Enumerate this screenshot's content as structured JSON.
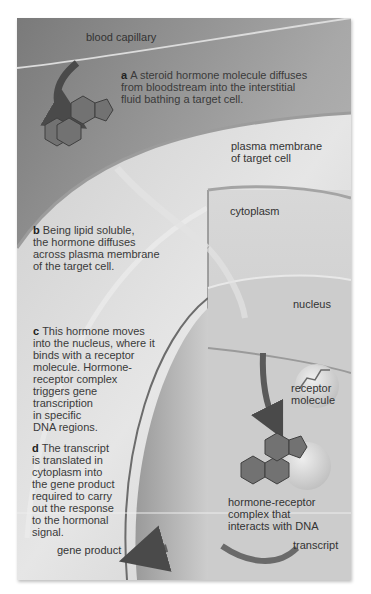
{
  "diagram": {
    "colors": {
      "background": "#ffffff",
      "interstitial": "#b5b5b5",
      "capillary": "#8e8e8e",
      "cytoplasm": "#d0d0d0",
      "nucleus": "#c6c6c6",
      "hormone_fill": "#6e6e6e",
      "arrow": "#555555",
      "text": "#333333"
    },
    "labels": {
      "blood_capillary": "blood capillary",
      "plasma_membrane": "plasma membrane of target cell",
      "plasma_membrane_line1": "plasma membrane",
      "plasma_membrane_line2": "of target cell",
      "cytoplasm": "cytoplasm",
      "nucleus": "nucleus",
      "receptor_line1": "receptor",
      "receptor_line2": "molecule",
      "complex_line1": "hormone-receptor",
      "complex_line2": "complex that",
      "complex_line3": "interacts with DNA",
      "transcript": "transcript",
      "gene_product": "gene product"
    },
    "steps": [
      {
        "letter": "a",
        "lines": [
          "A steroid hormone molecule diffuses",
          "from bloodstream into the interstitial",
          "fluid bathing a target cell."
        ]
      },
      {
        "letter": "b",
        "lines": [
          "Being lipid soluble,",
          "the hormone diffuses",
          "across plasma membrane",
          "of the target cell."
        ]
      },
      {
        "letter": "c",
        "lines": [
          "This hormone moves",
          "into the nucleus, where it",
          "binds with a receptor",
          "molecule. Hormone-",
          "receptor complex",
          "triggers gene",
          "transcription",
          "in specific",
          "DNA regions."
        ]
      },
      {
        "letter": "d",
        "lines": [
          "The transcript",
          "is translated in",
          "cytoplasm into",
          "the gene product",
          "required to carry",
          "out the response",
          "to the hormonal",
          "signal."
        ]
      }
    ],
    "icons": {
      "hormone": "steroid-ring-structure",
      "receptor": "receptor-molecule",
      "arrows": "curved-arrow"
    }
  }
}
